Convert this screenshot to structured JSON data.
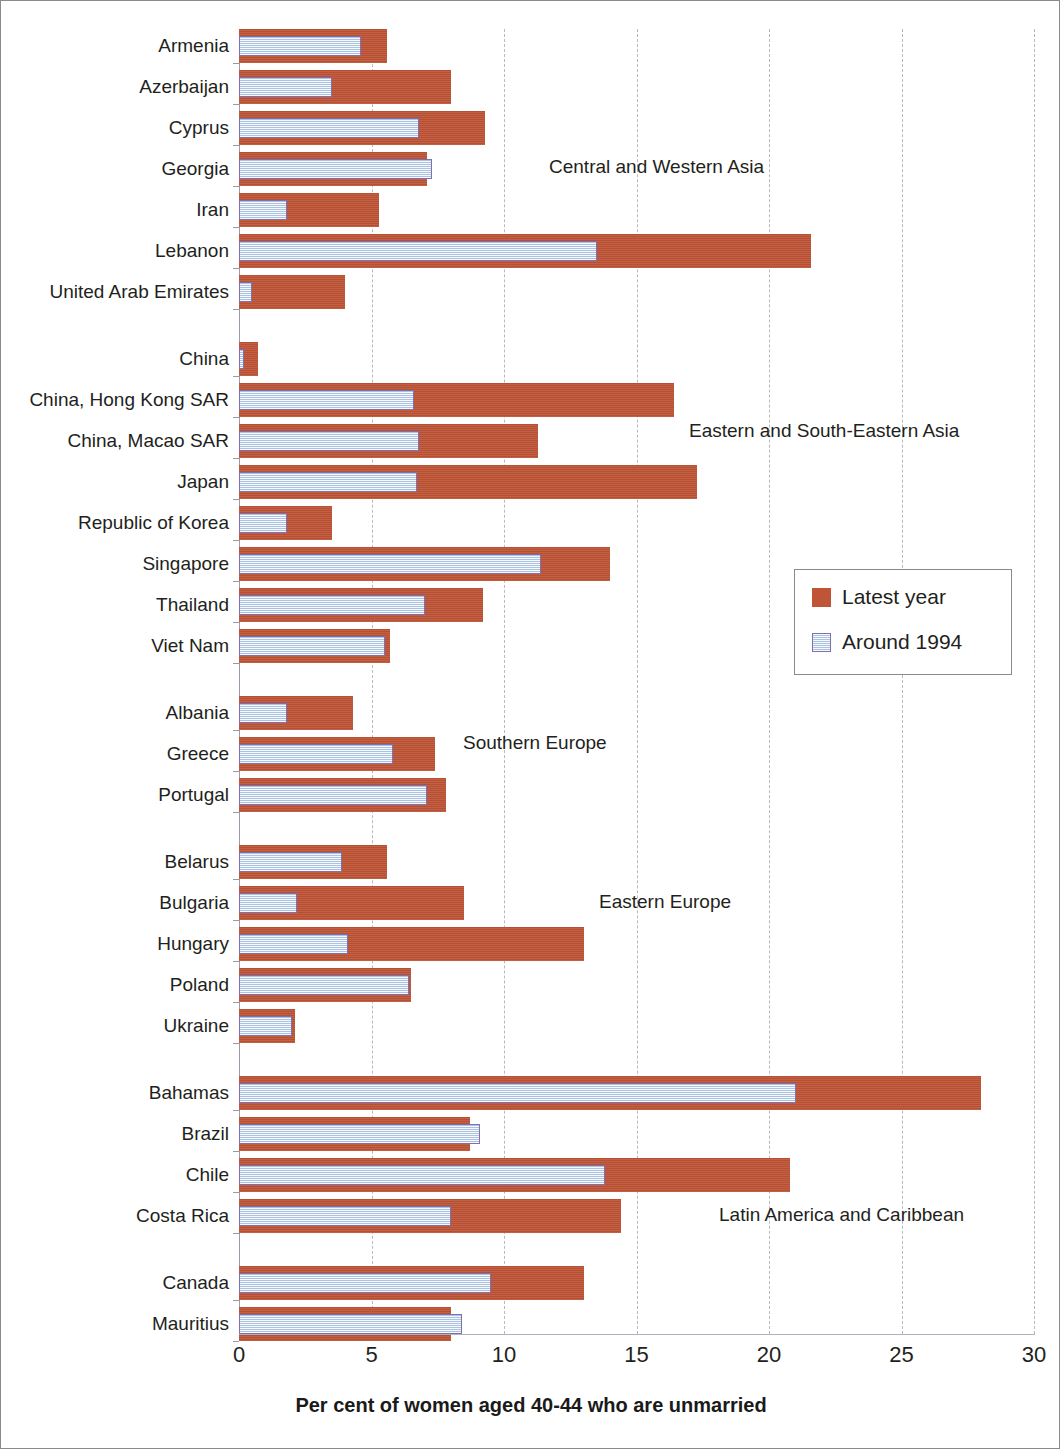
{
  "chart_data": {
    "type": "bar",
    "orientation": "horizontal",
    "title": "",
    "xlabel": "Per cent of women aged 40-44 who are unmarried",
    "ylabel": "",
    "xlim": [
      0,
      30
    ],
    "xticks": [
      0,
      5,
      10,
      15,
      20,
      25,
      30
    ],
    "grid": "vertical dashed gridlines at every x tick",
    "legend": {
      "position": "middle-right inside plot",
      "entries": [
        {
          "name": "Latest year",
          "color": "#bf5436"
        },
        {
          "name": "Around 1994",
          "color": "#c6d9f0",
          "border": "#8070b0"
        }
      ]
    },
    "series": [
      {
        "name": "Latest year",
        "color": "#bf5436"
      },
      {
        "name": "Around 1994",
        "color": "#c6d9f0"
      }
    ],
    "groups": [
      {
        "label": "Central and Western Asia",
        "categories": [
          "Armenia",
          "Azerbaijan",
          "Cyprus",
          "Georgia",
          "Iran",
          "Lebanon",
          "United Arab Emirates"
        ],
        "latest_year": [
          5.6,
          8.0,
          9.3,
          7.1,
          5.3,
          21.6,
          4.0
        ],
        "around_1994": [
          4.6,
          3.5,
          6.8,
          7.3,
          1.8,
          13.5,
          0.5
        ]
      },
      {
        "label": "Eastern and South-Eastern Asia",
        "categories": [
          "China",
          "China, Hong Kong SAR",
          "China, Macao SAR",
          "Japan",
          "Republic of Korea",
          "Singapore",
          "Thailand",
          "Viet Nam"
        ],
        "latest_year": [
          0.7,
          16.4,
          11.3,
          17.3,
          3.5,
          14.0,
          9.2,
          5.7
        ],
        "around_1994": [
          0.2,
          6.6,
          6.8,
          6.7,
          1.8,
          11.4,
          7.0,
          5.5
        ]
      },
      {
        "label": "Southern Europe",
        "categories": [
          "Albania",
          "Greece",
          "Portugal"
        ],
        "latest_year": [
          4.3,
          7.4,
          7.8
        ],
        "around_1994": [
          1.8,
          5.8,
          7.1
        ]
      },
      {
        "label": "Eastern Europe",
        "categories": [
          "Belarus",
          "Bulgaria",
          "Hungary",
          "Poland",
          "Ukraine"
        ],
        "latest_year": [
          5.6,
          8.5,
          13.0,
          6.5,
          2.1
        ],
        "around_1994": [
          3.9,
          2.2,
          4.1,
          6.4,
          2.0
        ]
      },
      {
        "label": "Latin America and Caribbean",
        "categories": [
          "Bahamas",
          "Brazil",
          "Chile",
          "Costa Rica"
        ],
        "latest_year": [
          28.0,
          8.7,
          20.8,
          14.4
        ],
        "around_1994": [
          21.0,
          9.1,
          13.8,
          8.0
        ]
      },
      {
        "label": "",
        "categories": [
          "Canada",
          "Mauritius"
        ],
        "latest_year": [
          13.0,
          8.0
        ],
        "around_1994": [
          9.5,
          8.4
        ]
      }
    ]
  },
  "axis": {
    "x_tick_labels": [
      "0",
      "5",
      "10",
      "15",
      "20",
      "25",
      "30"
    ],
    "x_title": "Per cent of women aged 40-44 who are unmarried"
  },
  "legend": {
    "items": [
      {
        "label": "Latest year"
      },
      {
        "label": "Around 1994"
      }
    ]
  },
  "annotations": [
    {
      "text": "Central and Western Asia"
    },
    {
      "text": "Eastern and South-Eastern Asia"
    },
    {
      "text": "Southern Europe"
    },
    {
      "text": "Eastern Europe"
    },
    {
      "text": "Latin America and Caribbean"
    }
  ],
  "colors": {
    "latest_year": "#bf5436",
    "around_1994_fill": "#c6d9f0",
    "around_1994_border": "#8070b0",
    "gridline": "#b9b9b9",
    "frame": "#8a8a8a",
    "text": "#231f20"
  }
}
